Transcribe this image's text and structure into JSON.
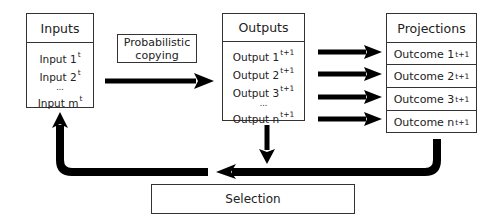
{
  "inputs": {
    "title": "Inputs",
    "items": [
      {
        "label": "Input 1",
        "sup": "t"
      },
      {
        "label": "Input 2",
        "sup": "t"
      },
      {
        "label": "...",
        "sup": ""
      },
      {
        "label": "Input m",
        "sup": "t"
      }
    ]
  },
  "copying": {
    "line1": "Probabilistic",
    "line2": "copying"
  },
  "outputs": {
    "title": "Outputs",
    "items": [
      {
        "label": "Output 1",
        "sup": "t+1"
      },
      {
        "label": "Output 2",
        "sup": "t+1"
      },
      {
        "label": "Output 3",
        "sup": "t+1"
      },
      {
        "label": "...",
        "sup": ""
      },
      {
        "label": "Output n",
        "sup": "t+1"
      }
    ]
  },
  "projections": {
    "title": "Projections",
    "items": [
      {
        "label": "Outcome 1",
        "sup": "t+1"
      },
      {
        "label": "Outcome 2",
        "sup": "t+1"
      },
      {
        "label": "Outcome 3",
        "sup": "t+1"
      },
      {
        "label": "Outcome n",
        "sup": "t+1"
      }
    ]
  },
  "selection": {
    "label": "Selection"
  },
  "colors": {
    "stroke": "#333333",
    "arrow": "#000000",
    "background": "#ffffff"
  }
}
